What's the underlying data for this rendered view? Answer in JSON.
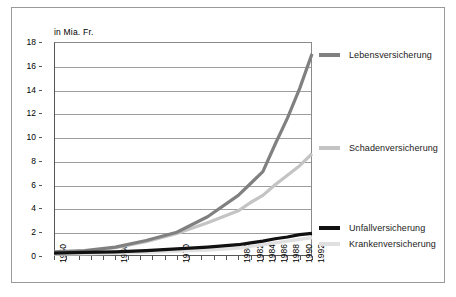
{
  "figure": {
    "axis_caption": "in Mia. Fr.",
    "frame_color": "#9a9a9a",
    "background": "#ffffff"
  },
  "chart_data": {
    "type": "line",
    "title": "",
    "subtitle": "",
    "xlabel": "",
    "ylabel": "in Mia. Fr.",
    "ylim": [
      0,
      18
    ],
    "xlim": [
      1950,
      1992
    ],
    "ytick_values": [
      0,
      2,
      4,
      6,
      8,
      10,
      12,
      14,
      16,
      18
    ],
    "ytick_labels": [
      "0",
      "2",
      "4",
      "6",
      "8",
      "10",
      "12",
      "14",
      "16",
      "18"
    ],
    "xtick_values": [
      1950,
      1952,
      1954,
      1956,
      1958,
      1960,
      1962,
      1964,
      1966,
      1968,
      1970,
      1972,
      1974,
      1976,
      1978,
      1980,
      1982,
      1984,
      1986,
      1988,
      1990,
      1992
    ],
    "xtick_labels_shown": [
      "1950",
      "1960",
      "1970",
      "1980",
      "1982",
      "1984",
      "1986",
      "1988",
      "1990",
      "1992"
    ],
    "xtick_labels_shown_values": [
      1950,
      1960,
      1970,
      1980,
      1982,
      1984,
      1986,
      1988,
      1990,
      1992
    ],
    "xtick_label_rotation": -90,
    "grid": true,
    "grid_axis": "y",
    "legend_position": "right",
    "x": [
      1950,
      1955,
      1960,
      1965,
      1970,
      1975,
      1980,
      1982,
      1984,
      1986,
      1988,
      1990,
      1992
    ],
    "series": [
      {
        "name": "Lebensversicherung",
        "color": "#808080",
        "width": 3.2,
        "values": [
          0.35,
          0.45,
          0.75,
          1.3,
          2.0,
          3.3,
          5.1,
          6.1,
          7.1,
          9.4,
          11.6,
          14.1,
          17.0
        ]
      },
      {
        "name": "Schadenversicherung",
        "color": "#c4c4c4",
        "width": 3.2,
        "values": [
          0.3,
          0.4,
          0.7,
          1.2,
          1.9,
          2.8,
          3.8,
          4.5,
          5.1,
          6.0,
          6.8,
          7.6,
          8.6
        ]
      },
      {
        "name": "Unfallversicherung",
        "color": "#111111",
        "width": 3.2,
        "values": [
          0.25,
          0.3,
          0.35,
          0.45,
          0.6,
          0.75,
          0.95,
          1.1,
          1.25,
          1.45,
          1.6,
          1.8,
          1.9
        ]
      },
      {
        "name": "Krankenversicherung",
        "color": "#e0e0e0",
        "width": 3.2,
        "values": [
          0.15,
          0.18,
          0.22,
          0.3,
          0.4,
          0.5,
          0.65,
          0.8,
          0.95,
          1.1,
          1.25,
          1.4,
          1.55
        ]
      }
    ]
  },
  "legend": {
    "entries": [
      {
        "label": "Lebensversicherung",
        "color": "#808080",
        "top": 42
      },
      {
        "label": "Schadenversicherung",
        "color": "#c4c4c4",
        "top": 135
      },
      {
        "label": "Unfallversicherung",
        "color": "#111111",
        "top": 215
      },
      {
        "label": "Krankenversicherung",
        "color": "#e0e0e0",
        "top": 231
      }
    ]
  }
}
